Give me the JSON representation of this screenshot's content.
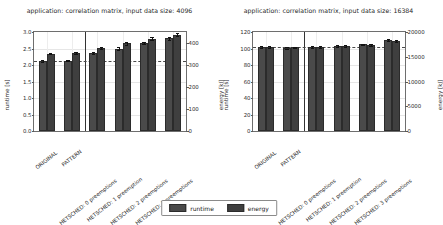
{
  "figure": {
    "background": "#ffffff",
    "bar_color_runtime": "#4a4a4a",
    "bar_color_energy": "#3f3f3f"
  },
  "legend": {
    "items": [
      {
        "label": "runtime",
        "color": "#4a4a4a",
        "icon": "legend-swatch-icon"
      },
      {
        "label": "energy",
        "color": "#3f3f3f",
        "icon": "legend-swatch-icon"
      }
    ]
  },
  "chart_data": [
    {
      "type": "bar",
      "title": "application: correlation matrix, input data size: 4096",
      "xlabel": "",
      "ylabel": "runtime [s]",
      "y2label": "energy [kJ]",
      "ylim": [
        0.0,
        3.0
      ],
      "y2lim": [
        0,
        450
      ],
      "yticks": [
        "0.0",
        "0.5",
        "1.0",
        "1.5",
        "2.0",
        "2.5",
        "3.0"
      ],
      "ytick_values": [
        0.0,
        0.5,
        1.0,
        1.5,
        2.0,
        2.5,
        3.0
      ],
      "y2ticks": [
        "0",
        "100",
        "200",
        "300",
        "400"
      ],
      "y2tick_values": [
        0,
        100,
        200,
        300,
        400
      ],
      "grid": true,
      "legend_position": "below-figure",
      "baseline_dashed_y": 2.12,
      "group_separator_after_category": 1,
      "categories": [
        "ORIGINAL",
        "PATTERN",
        "HETSCHED: 0 preemptions",
        "HETSCHED: 1 preemption",
        "HETSCHED: 2 preemptions",
        "HETSCHED: 3 preemptions"
      ],
      "series": [
        {
          "name": "runtime",
          "unit": "s",
          "axis": "left",
          "values": [
            2.12,
            2.13,
            2.36,
            2.5,
            2.67,
            2.81
          ],
          "errors": [
            0.02,
            0.02,
            0.04,
            0.04,
            0.04,
            0.04
          ]
        },
        {
          "name": "energy",
          "unit": "kJ",
          "axis": "right",
          "values": [
            352,
            354,
            378,
            398,
            420,
            438
          ],
          "errors": [
            4,
            4,
            5,
            6,
            6,
            6
          ]
        }
      ]
    },
    {
      "type": "bar",
      "title": "application: correlation matrix, input data size: 16384",
      "xlabel": "",
      "ylabel": "runtime [s]",
      "y2label": "energy [kJ]",
      "ylim": [
        0,
        120
      ],
      "y2lim": [
        0,
        20000
      ],
      "yticks": [
        "0",
        "20",
        "40",
        "60",
        "80",
        "100",
        "120"
      ],
      "ytick_values": [
        0,
        20,
        40,
        60,
        80,
        100,
        120
      ],
      "y2ticks": [
        "0",
        "5000",
        "10000",
        "15000",
        "20000"
      ],
      "y2tick_values": [
        0,
        5000,
        10000,
        15000,
        20000
      ],
      "grid": true,
      "legend_position": "below-figure",
      "baseline_dashed_y": 102,
      "group_separator_after_category": 1,
      "categories": [
        "ORIGINAL",
        "PATTERN",
        "HETSCHED: 0 preemptions",
        "HETSCHED: 1 preemption",
        "HETSCHED: 2 preemptions",
        "HETSCHED: 3 preemptions"
      ],
      "series": [
        {
          "name": "runtime",
          "unit": "s",
          "axis": "left",
          "values": [
            102,
            101,
            102,
            103,
            105,
            110
          ],
          "errors": [
            1.0,
            1.0,
            1.0,
            1.0,
            1.0,
            1.5
          ]
        },
        {
          "name": "energy",
          "unit": "kJ",
          "axis": "right",
          "values": [
            17000,
            16900,
            17000,
            17150,
            17400,
            18100
          ],
          "errors": [
            150,
            150,
            150,
            150,
            180,
            200
          ]
        }
      ]
    }
  ]
}
